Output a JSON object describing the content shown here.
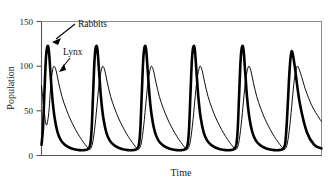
{
  "chart_data": {
    "type": "line",
    "title": "",
    "xlabel": "Time",
    "ylabel": "Population",
    "grid": false,
    "legend_position": "inline-annotations",
    "xlim": [
      0,
      5.75
    ],
    "ylim": [
      0,
      150
    ],
    "yticks": [
      0,
      50,
      100,
      150
    ],
    "ytick_labels": [
      "0",
      "50",
      "100",
      "150"
    ],
    "xticks": [],
    "xtick_labels": [],
    "annotations": [
      {
        "text": "Rabbits",
        "points_to_series": "Rabbits",
        "x_px": 78,
        "y_px": 24
      },
      {
        "text": "Lynx",
        "points_to_series": "Lynx",
        "x_px": 64,
        "y_px": 52
      }
    ],
    "series": [
      {
        "name": "Rabbits",
        "style": "thick",
        "peak_value": 122,
        "trough_value": 7,
        "period": 1.0,
        "peak_times": [
          0.12,
          1.12,
          2.12,
          3.12,
          4.12
        ],
        "x": [
          0.0,
          0.03,
          0.06,
          0.09,
          0.12,
          0.15,
          0.18,
          0.22,
          0.27,
          0.33,
          0.4,
          0.48,
          0.57,
          0.67,
          0.78,
          0.88,
          0.95,
          1.0,
          1.03,
          1.06,
          1.09,
          1.12,
          1.15,
          1.18,
          1.22,
          1.27,
          1.33,
          1.4,
          1.48,
          1.57,
          1.67,
          1.78,
          1.88,
          1.95,
          2.0,
          2.03,
          2.06,
          2.09,
          2.12,
          2.15,
          2.18,
          2.22,
          2.27,
          2.33,
          2.4,
          2.48,
          2.57,
          2.67,
          2.78,
          2.88,
          2.95,
          3.0,
          3.03,
          3.06,
          3.09,
          3.12,
          3.15,
          3.18,
          3.22,
          3.27,
          3.33,
          3.4,
          3.48,
          3.57,
          3.67,
          3.78,
          3.88,
          3.95,
          4.0,
          4.03,
          4.06,
          4.09,
          4.12,
          4.15,
          4.18,
          4.22,
          4.27,
          4.33,
          4.4,
          4.48,
          4.57,
          4.67,
          4.78,
          4.88,
          4.95,
          5.0,
          5.03,
          5.06,
          5.09,
          5.12,
          5.15,
          5.2,
          5.3,
          5.45,
          5.6,
          5.75
        ],
        "y": [
          12,
          30,
          70,
          108,
          122,
          118,
          96,
          66,
          42,
          26,
          17,
          12,
          9,
          7,
          6,
          6,
          7,
          12,
          30,
          70,
          108,
          122,
          118,
          96,
          66,
          42,
          26,
          17,
          12,
          9,
          7,
          6,
          6,
          7,
          12,
          30,
          70,
          108,
          122,
          118,
          96,
          66,
          42,
          26,
          17,
          12,
          9,
          7,
          6,
          6,
          7,
          12,
          30,
          70,
          108,
          122,
          118,
          96,
          66,
          42,
          26,
          17,
          12,
          9,
          7,
          6,
          6,
          7,
          12,
          30,
          70,
          108,
          122,
          118,
          96,
          66,
          42,
          26,
          17,
          12,
          9,
          7,
          6,
          6,
          7,
          12,
          30,
          60,
          92,
          112,
          116,
          100,
          60,
          26,
          12,
          8
        ]
      },
      {
        "name": "Lynx",
        "style": "thin",
        "peak_value": 100,
        "trough_value": 5,
        "period": 1.0,
        "peak_times": [
          0.26,
          1.26,
          2.26,
          3.26,
          4.26
        ],
        "x": [
          0.0,
          0.05,
          0.1,
          0.15,
          0.19,
          0.23,
          0.26,
          0.3,
          0.35,
          0.42,
          0.5,
          0.58,
          0.66,
          0.74,
          0.82,
          0.9,
          0.96,
          1.0,
          1.05,
          1.1,
          1.15,
          1.19,
          1.23,
          1.26,
          1.3,
          1.35,
          1.42,
          1.5,
          1.58,
          1.66,
          1.74,
          1.82,
          1.9,
          1.96,
          2.0,
          2.05,
          2.1,
          2.15,
          2.19,
          2.23,
          2.26,
          2.3,
          2.35,
          2.42,
          2.5,
          2.58,
          2.66,
          2.74,
          2.82,
          2.9,
          2.96,
          3.0,
          3.05,
          3.1,
          3.15,
          3.19,
          3.23,
          3.26,
          3.3,
          3.35,
          3.42,
          3.5,
          3.58,
          3.66,
          3.74,
          3.82,
          3.9,
          3.96,
          4.0,
          4.05,
          4.1,
          4.15,
          4.19,
          4.23,
          4.26,
          4.3,
          4.35,
          4.42,
          4.5,
          4.58,
          4.66,
          4.74,
          4.82,
          4.9,
          4.96,
          5.0,
          5.05,
          5.1,
          5.15,
          5.19,
          5.23,
          5.26,
          5.32,
          5.42,
          5.55,
          5.7,
          5.75
        ],
        "y": [
          78,
          52,
          34,
          48,
          78,
          96,
          100,
          95,
          82,
          66,
          53,
          42,
          33,
          25,
          18,
          12,
          8,
          7,
          14,
          34,
          62,
          84,
          96,
          100,
          95,
          82,
          66,
          53,
          42,
          33,
          25,
          18,
          12,
          8,
          7,
          14,
          34,
          62,
          84,
          96,
          100,
          95,
          82,
          66,
          53,
          42,
          33,
          25,
          18,
          12,
          8,
          7,
          14,
          34,
          62,
          84,
          96,
          100,
          95,
          82,
          66,
          53,
          42,
          33,
          25,
          18,
          12,
          8,
          7,
          14,
          34,
          62,
          84,
          96,
          100,
          95,
          82,
          66,
          53,
          42,
          33,
          25,
          18,
          12,
          8,
          7,
          14,
          34,
          62,
          84,
          96,
          100,
          92,
          74,
          56,
          42,
          38
        ]
      }
    ]
  },
  "axes": {
    "ylabel": "Population",
    "xlabel": "Time"
  }
}
